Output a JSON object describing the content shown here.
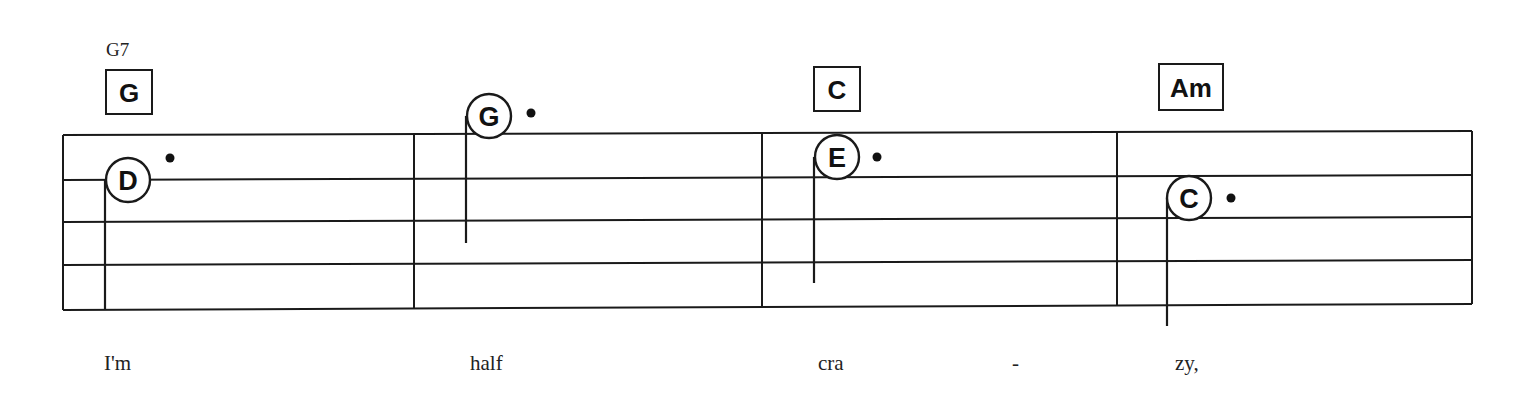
{
  "score": {
    "staff": {
      "left_x": 63,
      "right_x": 1472,
      "lines_y_left": [
        135,
        180,
        222,
        265,
        310
      ],
      "lines_y_right": [
        131,
        175,
        217,
        260,
        304
      ]
    },
    "barlines_x": [
      63,
      414,
      762,
      1117,
      1472
    ],
    "alt_chord": {
      "label": "G7",
      "x": 106,
      "y": 56
    },
    "chords": [
      {
        "label": "G",
        "x": 106,
        "y": 70,
        "w": 46,
        "h": 44
      },
      {
        "label": "C",
        "x": 814,
        "y": 67,
        "w": 46,
        "h": 44
      },
      {
        "label": "Am",
        "x": 1159,
        "y": 64,
        "w": 64,
        "h": 46
      }
    ],
    "notes": [
      {
        "letter": "D",
        "cx": 128,
        "cy": 180,
        "r": 22,
        "stem_x": 105,
        "stem_top": 180,
        "stem_bottom": 309,
        "dot_x": 170,
        "dot_y": 158
      },
      {
        "letter": "G",
        "cx": 489,
        "cy": 116,
        "r": 22,
        "stem_x": 466,
        "stem_top": 116,
        "stem_bottom": 243,
        "dot_x": 531,
        "dot_y": 113
      },
      {
        "letter": "E",
        "cx": 837,
        "cy": 157,
        "r": 22,
        "stem_x": 814,
        "stem_top": 157,
        "stem_bottom": 283,
        "dot_x": 877,
        "dot_y": 157
      },
      {
        "letter": "C",
        "cx": 1189,
        "cy": 198,
        "r": 22,
        "stem_x": 1167,
        "stem_top": 198,
        "stem_bottom": 326,
        "dot_x": 1231,
        "dot_y": 198
      }
    ],
    "lyrics": [
      {
        "text": "I'm",
        "x": 104,
        "y": 370
      },
      {
        "text": "half",
        "x": 470,
        "y": 370
      },
      {
        "text": "cra",
        "x": 818,
        "y": 370
      },
      {
        "text": "-",
        "x": 1012,
        "y": 370
      },
      {
        "text": "zy,",
        "x": 1175,
        "y": 370
      }
    ]
  }
}
